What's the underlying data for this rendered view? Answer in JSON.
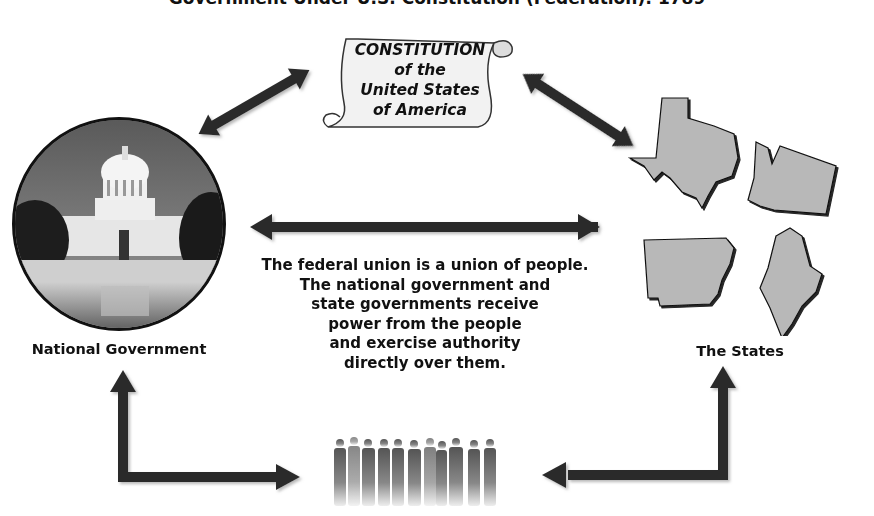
{
  "diagram": {
    "title": "Government Under U.S. Constitution (Federation): 1789",
    "constitution": {
      "lines": [
        "CONSTITUTION",
        "of the",
        "United States",
        "of America"
      ]
    },
    "national_government": {
      "label": "National Government",
      "image": "us-capitol-building-photo"
    },
    "states": {
      "label": "The States",
      "shapes": [
        "Texas",
        "Washington",
        "Arkansas",
        "Maine"
      ]
    },
    "people": {
      "image": "group-of-people-silhouettes"
    },
    "central_text": {
      "lines": [
        "The federal union is a union of people.",
        "The national government and",
        "state governments receive",
        "power from the people",
        "and exercise authority",
        "directly over them."
      ]
    },
    "arrows": [
      {
        "from": "constitution",
        "to": "national_government",
        "type": "double"
      },
      {
        "from": "constitution",
        "to": "states",
        "type": "double"
      },
      {
        "from": "national_government",
        "to": "states",
        "type": "double"
      },
      {
        "from": "people",
        "to": "national_government",
        "type": "single-elbow"
      },
      {
        "from": "people",
        "to": "states",
        "type": "single-elbow"
      }
    ],
    "colors": {
      "arrow": "#2b2b2b",
      "state_fill": "#b8b8b8",
      "scroll_fill": "#f2f2f2",
      "text": "#111111"
    }
  }
}
